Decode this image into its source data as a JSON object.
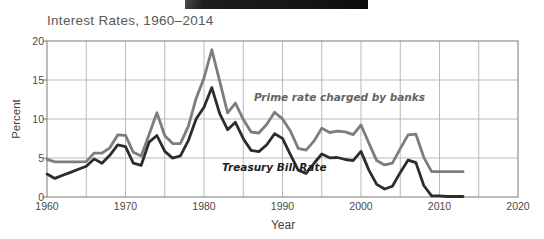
{
  "chart_data": {
    "type": "line",
    "title": "Interest Rates, 1960–2014",
    "xlabel": "Year",
    "ylabel": "Percent",
    "xlim": [
      1960,
      2020
    ],
    "ylim": [
      0,
      20
    ],
    "xticks": [
      1960,
      1970,
      1980,
      1990,
      2000,
      2010,
      2020
    ],
    "yticks": [
      0,
      5,
      10,
      15,
      20
    ],
    "x_gridlines": [
      1965,
      1970,
      1975,
      1980,
      1985,
      1990,
      1995,
      2000,
      2005,
      2010,
      2015
    ],
    "y_gridlines": [
      5,
      10,
      15
    ],
    "grid": true,
    "legend_position": "inline-annotations",
    "colors": {
      "grid": "#b9b9b9",
      "border": "#8f8f8f"
    },
    "x": [
      1960,
      1961,
      1962,
      1963,
      1964,
      1965,
      1966,
      1967,
      1968,
      1969,
      1970,
      1971,
      1972,
      1973,
      1974,
      1975,
      1976,
      1977,
      1978,
      1979,
      1980,
      1981,
      1982,
      1983,
      1984,
      1985,
      1986,
      1987,
      1988,
      1989,
      1990,
      1991,
      1992,
      1993,
      1994,
      1995,
      1996,
      1997,
      1998,
      1999,
      2000,
      2001,
      2002,
      2003,
      2004,
      2005,
      2006,
      2007,
      2008,
      2009,
      2010,
      2011,
      2012,
      2013
    ],
    "series": [
      {
        "name": "prime-rate",
        "label": "Prime rate charged by banks",
        "color": "#7d7d7d",
        "values": [
          4.82,
          4.5,
          4.5,
          4.5,
          4.5,
          4.54,
          5.63,
          5.63,
          6.31,
          7.96,
          7.91,
          5.73,
          5.25,
          8.03,
          10.81,
          7.86,
          6.84,
          6.83,
          9.06,
          12.67,
          15.26,
          18.87,
          14.85,
          10.79,
          12.04,
          9.93,
          8.33,
          8.21,
          9.32,
          10.87,
          10.01,
          8.46,
          6.25,
          6.0,
          7.15,
          8.83,
          8.27,
          8.44,
          8.35,
          8.0,
          9.23,
          6.91,
          4.67,
          4.12,
          4.34,
          6.19,
          7.96,
          8.05,
          5.09,
          3.25,
          3.25,
          3.25,
          3.25,
          3.25
        ]
      },
      {
        "name": "treasury-bill-rate",
        "label": "Treasury Bill Rate",
        "color": "#2d2d2d",
        "values": [
          2.93,
          2.38,
          2.78,
          3.16,
          3.55,
          3.95,
          4.88,
          4.32,
          5.34,
          6.68,
          6.46,
          4.35,
          4.07,
          7.04,
          7.89,
          5.84,
          4.99,
          5.27,
          7.22,
          10.04,
          11.51,
          14.03,
          10.69,
          8.63,
          9.58,
          7.48,
          5.98,
          5.82,
          6.69,
          8.12,
          7.51,
          5.42,
          3.45,
          3.02,
          4.29,
          5.51,
          5.02,
          5.07,
          4.81,
          4.66,
          5.85,
          3.45,
          1.62,
          1.02,
          1.38,
          3.16,
          4.73,
          4.41,
          1.48,
          0.16,
          0.14,
          0.06,
          0.09,
          0.06
        ]
      }
    ]
  }
}
